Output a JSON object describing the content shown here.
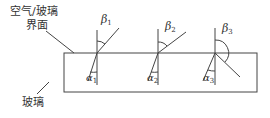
{
  "labels": {
    "interface_line1": "空气/玻璃",
    "interface_line2": "界面",
    "glass": "玻璃"
  },
  "angles": [
    {
      "incident": "α",
      "incident_sub": "1",
      "refracted": "β",
      "refracted_sub": "1"
    },
    {
      "incident": "α",
      "incident_sub": "2",
      "refracted": "β",
      "refracted_sub": "2"
    },
    {
      "incident": "α",
      "incident_sub": "3",
      "refracted": "β",
      "refracted_sub": "3"
    }
  ],
  "colors": {
    "line": "#444444",
    "text": "#333333"
  }
}
